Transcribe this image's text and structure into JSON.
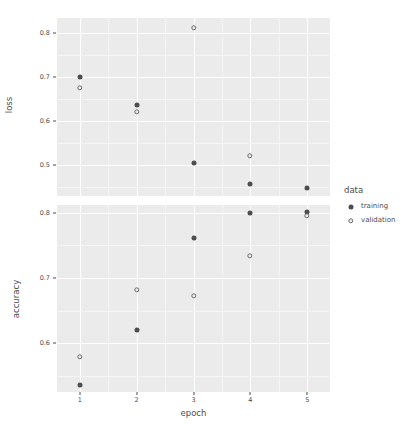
{
  "chart_data": {
    "type": "scatter",
    "title": "",
    "xlabel": "epoch",
    "facet_layout": "vertical",
    "grid": true,
    "legend_position": "right",
    "legend_title": "data",
    "legend_entries": [
      "training",
      "validation"
    ],
    "x": [
      1,
      2,
      3,
      4,
      5
    ],
    "xticklabels": [
      "1",
      "2",
      "3",
      "4",
      "5"
    ],
    "xlim": [
      0.6,
      5.4
    ],
    "panels": [
      {
        "name": "loss",
        "ylabel": "loss",
        "yticklabels": [
          "0.8",
          "0.7",
          "0.6",
          "0.5"
        ],
        "yticks": [
          0.8,
          0.7,
          0.6,
          0.5
        ],
        "ylim": [
          0.43,
          0.835
        ],
        "series": [
          {
            "name": "training",
            "values": [
              0.7,
              0.638,
              0.505,
              0.458,
              0.448
            ]
          },
          {
            "name": "validation",
            "values": [
              0.675,
              0.622,
              0.812,
              0.522,
              null
            ]
          }
        ]
      },
      {
        "name": "accuracy",
        "ylabel": "accuracy",
        "yticklabels": [
          "0.8",
          "0.7",
          "0.6"
        ],
        "yticks": [
          0.8,
          0.7,
          0.6
        ],
        "ylim": [
          0.525,
          0.812
        ],
        "series": [
          {
            "name": "training",
            "values": [
              0.535,
              0.62,
              0.762,
              0.8,
              0.802
            ]
          },
          {
            "name": "validation",
            "values": [
              0.578,
              0.682,
              0.672,
              0.733,
              0.795
            ]
          }
        ]
      }
    ],
    "colors": {
      "panel_background": "#ebebeb",
      "plot_background": "#ffffff",
      "grid_major": "#ffffff",
      "grid_minor": "#f5f5f5",
      "point": "#4d4d4d",
      "text": "#4d4d4d"
    }
  }
}
